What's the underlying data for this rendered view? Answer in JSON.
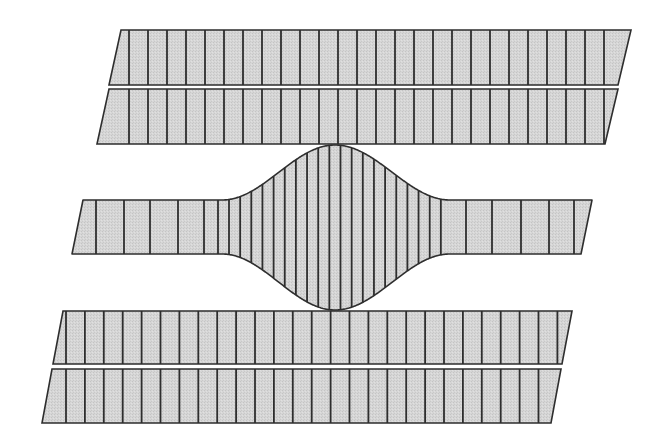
{
  "canvas": {
    "width": 659,
    "height": 445,
    "background": "#ffffff"
  },
  "style": {
    "fill": "#d3d3d3",
    "stroke": "#2e2e2e",
    "outline_width": 1.6,
    "line_width": 1.8
  },
  "bands": [
    {
      "name": "top-band-1",
      "top_y": 30,
      "bottom_y": 85,
      "top_left_x": 121,
      "top_right_x": 631,
      "bottom_left_x": 109,
      "bottom_right_x": 618,
      "lines": {
        "start": 129,
        "step": 19,
        "count": 26
      }
    },
    {
      "name": "top-band-2",
      "top_y": 89,
      "bottom_y": 144,
      "top_left_x": 109,
      "top_right_x": 618,
      "bottom_left_x": 97,
      "bottom_right_x": 605,
      "lines": {
        "start": 129,
        "step": 19,
        "count": 26
      }
    },
    {
      "name": "bottom-band-1",
      "top_y": 311,
      "bottom_y": 364,
      "top_left_x": 63,
      "top_right_x": 572,
      "bottom_left_x": 53,
      "bottom_right_x": 562,
      "lines": {
        "start": 66,
        "step": 18.9,
        "count": 27
      }
    },
    {
      "name": "bottom-band-2",
      "top_y": 369,
      "bottom_y": 423,
      "top_left_x": 52,
      "top_right_x": 561,
      "bottom_left_x": 42,
      "bottom_right_x": 551,
      "lines": {
        "start": 66,
        "step": 18.9,
        "count": 26
      }
    }
  ],
  "middle_band": {
    "name": "middle-band-with-bulge",
    "top_y": 200,
    "bottom_y": 254,
    "top_left_x": 83,
    "bottom_left_x": 72,
    "top_right_x": 592,
    "bottom_right_x": 581,
    "bulge": {
      "start_x": 222,
      "end_x": 450,
      "peak_x": 335,
      "peak_top_y": 145,
      "peak_bottom_y": 310
    },
    "left_lines": [
      96,
      124,
      150,
      178,
      204,
      218
    ],
    "bulge_lines": {
      "start": 229,
      "step": 11.15,
      "count": 20
    },
    "right_lines": [
      466,
      492,
      521,
      549,
      574
    ]
  }
}
